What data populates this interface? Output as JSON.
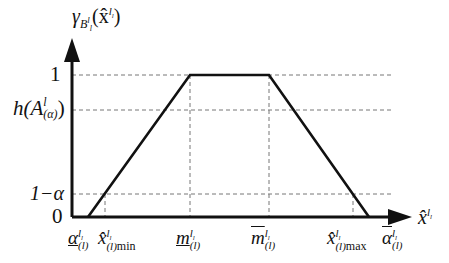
{
  "diagram": {
    "type": "trapezoidal-membership-function",
    "y_axis": {
      "label_main": "γ",
      "label_sub": "B",
      "label_sub2": "l",
      "label_sub3": "l",
      "label_arg": "(x̂",
      "label_arg_sup": "l",
      "label_arg_sup_sub": "l",
      "label_close": ")",
      "ticks": [
        {
          "id": "one",
          "text": "1"
        },
        {
          "id": "h",
          "text_main": "h(A",
          "text_sup": "l",
          "text_sub": "(α)",
          "text_close": ")"
        },
        {
          "id": "one-minus-alpha",
          "text": "1−α"
        },
        {
          "id": "zero",
          "text": "0"
        }
      ]
    },
    "x_axis": {
      "label_main": "x̂",
      "label_sup": "l",
      "label_sup_sub": "l",
      "ticks": [
        {
          "id": "alpha-lower",
          "main": "α",
          "sup": "l",
          "sup_sub": "l",
          "sub": "(l)"
        },
        {
          "id": "x-min",
          "main": "x̂",
          "sup": "l",
          "sup_sub": "l",
          "sub": "(l)",
          "suffix": "min"
        },
        {
          "id": "m-lower",
          "main": "m",
          "sup": "l",
          "sup_sub": "l",
          "sub": "(l)"
        },
        {
          "id": "m-upper",
          "main": "m",
          "sup": "l",
          "sup_sub": "l",
          "sub": "(l)"
        },
        {
          "id": "x-max",
          "main": "x̂",
          "sup": "l",
          "sup_sub": "l",
          "sub": "(l)",
          "suffix": "max"
        },
        {
          "id": "alpha-upper",
          "main": "α",
          "sup": "l",
          "sup_sub": "l",
          "sub": "(l)"
        }
      ]
    },
    "shape_points": [
      [
        88,
        217
      ],
      [
        190,
        75
      ],
      [
        269,
        75
      ],
      [
        369,
        217
      ]
    ],
    "colors": {
      "line": "#111111",
      "dash": "#777777",
      "background": "#ffffff"
    }
  }
}
